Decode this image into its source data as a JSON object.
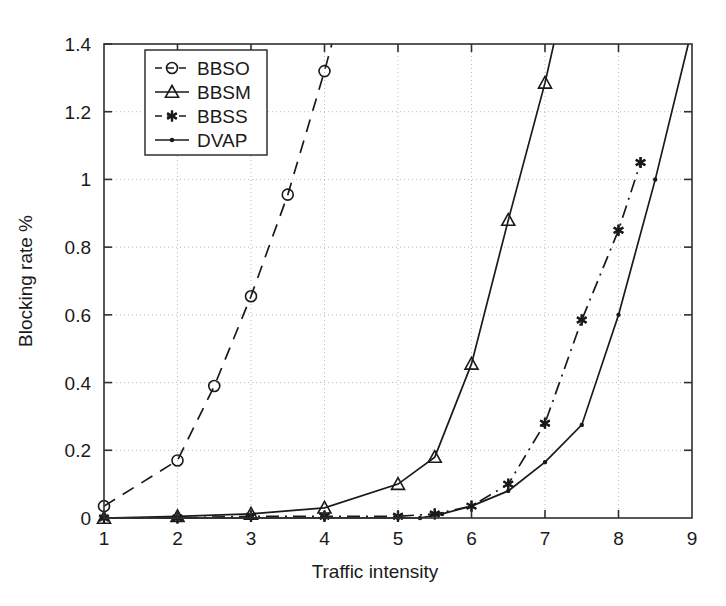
{
  "chart_data": {
    "type": "line",
    "title": "",
    "xlabel": "Traffic intensity",
    "ylabel": "Blocking rate %",
    "xlim": [
      1,
      9
    ],
    "ylim": [
      0,
      1.4
    ],
    "xticks": [
      "1",
      "2",
      "3",
      "4",
      "5",
      "6",
      "7",
      "8",
      "9"
    ],
    "yticks": [
      "0",
      "0.2",
      "0.4",
      "0.6",
      "0.8",
      "1",
      "1.2",
      "1.4"
    ],
    "grid": true,
    "legend_position": "top-left",
    "series": [
      {
        "name": "BBSO",
        "marker": "circle",
        "linestyle": "dashed",
        "color": "#1a1a1a",
        "x": [
          1,
          2,
          2.5,
          3,
          3.5,
          4,
          4.1
        ],
        "y": [
          0.035,
          0.17,
          0.39,
          0.655,
          0.955,
          1.32,
          1.4
        ]
      },
      {
        "name": "BBSM",
        "marker": "triangle",
        "linestyle": "solid",
        "color": "#1a1a1a",
        "x": [
          1,
          2,
          3,
          4,
          5,
          5.5,
          6,
          6.5,
          7,
          7.12
        ],
        "y": [
          0.0,
          0.005,
          0.012,
          0.03,
          0.1,
          0.18,
          0.455,
          0.88,
          1.285,
          1.4
        ]
      },
      {
        "name": "BBSS",
        "marker": "asterisk",
        "linestyle": "dashdot",
        "color": "#1a1a1a",
        "x": [
          1,
          2,
          3,
          4,
          5,
          5.5,
          6,
          6.5,
          7,
          7.5,
          8,
          8.3
        ],
        "y": [
          0.0,
          0.0,
          0.005,
          0.005,
          0.005,
          0.012,
          0.035,
          0.1,
          0.28,
          0.585,
          0.85,
          1.05
        ]
      },
      {
        "name": "DVAP",
        "marker": "dot",
        "linestyle": "solid",
        "color": "#1a1a1a",
        "x": [
          1,
          2,
          3,
          4,
          5,
          5.3,
          5.6,
          6,
          6.5,
          7,
          7.5,
          8,
          8.5,
          8.95
        ],
        "y": [
          0.0,
          0.0,
          0.0,
          0.0,
          0.0,
          0.0,
          0.012,
          0.035,
          0.08,
          0.165,
          0.275,
          0.6,
          1.0,
          1.4
        ]
      }
    ]
  },
  "legend": {
    "entries": [
      {
        "label": "BBSO"
      },
      {
        "label": "BBSM"
      },
      {
        "label": "BBSS"
      },
      {
        "label": "DVAP"
      }
    ]
  }
}
